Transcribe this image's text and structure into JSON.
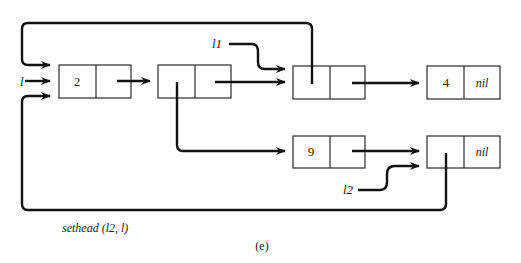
{
  "diagram": {
    "type": "linked-list-pointer-diagram",
    "caption": "sethead (l2, l)",
    "subfigure_label": "(e)",
    "variables": {
      "l": "l",
      "l1": "l1",
      "l2": "l2"
    },
    "nodes": [
      {
        "id": "n1",
        "head": "2",
        "tail": ""
      },
      {
        "id": "n2",
        "head": "",
        "tail": ""
      },
      {
        "id": "n3",
        "head": "",
        "tail": ""
      },
      {
        "id": "n4",
        "head": "4",
        "tail": "nil"
      },
      {
        "id": "n5",
        "head": "9",
        "tail": ""
      },
      {
        "id": "n6",
        "head": "",
        "tail": "nil"
      }
    ],
    "edges": [
      {
        "from": "l",
        "to": "n1"
      },
      {
        "from": "n1.tail",
        "to": "n2"
      },
      {
        "from": "n2.head",
        "to": "n5"
      },
      {
        "from": "n2.tail",
        "to": "n3"
      },
      {
        "from": "l1",
        "to": "n3"
      },
      {
        "from": "n3.head",
        "to": "n1"
      },
      {
        "from": "n3.tail",
        "to": "n4"
      },
      {
        "from": "n5.tail",
        "to": "n6"
      },
      {
        "from": "l2",
        "to": "n6"
      },
      {
        "from": "n6.head",
        "to": "n1"
      }
    ]
  }
}
